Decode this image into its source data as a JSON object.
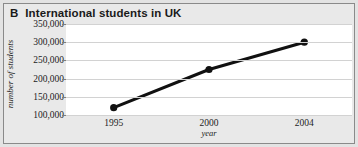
{
  "panel": {
    "letter": "B",
    "title": "International students in UK"
  },
  "colors": {
    "figure_background": "#e9e9e9",
    "plot_background": "#ffffff",
    "gridline": "#d2d2d2",
    "line": "#111111",
    "marker": "#111111",
    "text": "#1c1c1c",
    "border": "#8a8a8a"
  },
  "chart_data": {
    "type": "line",
    "title": "International students in UK",
    "xlabel": "year",
    "ylabel": "number of students",
    "x": [
      1995,
      2000,
      2004
    ],
    "categories": [
      "1995",
      "2000",
      "2004"
    ],
    "values": [
      120000,
      225000,
      300000
    ],
    "series": [
      {
        "name": "International students in UK",
        "values": [
          120000,
          225000,
          300000
        ]
      }
    ],
    "ylim": [
      100000,
      350000
    ],
    "ytick_values": [
      350000,
      300000,
      250000,
      200000,
      150000,
      100000
    ],
    "ytick_labels": [
      "350,000",
      "300,000",
      "250,000",
      "200,000",
      "150,000",
      "100,000"
    ],
    "xtick_labels": [
      "1995",
      "2000",
      "2004"
    ],
    "grid": true,
    "grid_axis": "y",
    "legend": false,
    "markers": "filled-circle"
  }
}
